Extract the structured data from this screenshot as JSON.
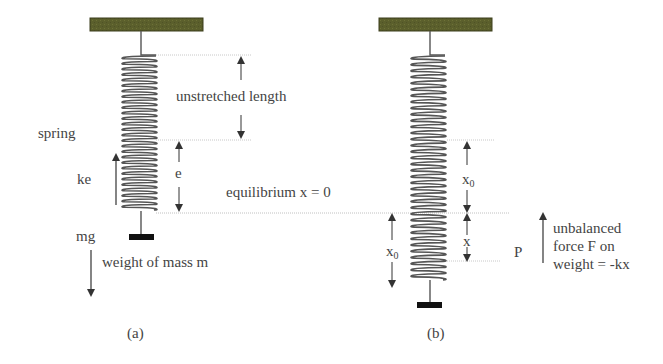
{
  "figure": {
    "colors": {
      "ceiling": "#5b5f2c",
      "ceiling_border": "#3d3f1c",
      "spring": "#555555",
      "mass": "#111111",
      "text": "#444444",
      "arrow": "#333333",
      "dotted_line": "#bbbbbb"
    },
    "panel_a": {
      "caption": "(a)",
      "labels": {
        "spring": "spring",
        "ke": "ke",
        "mg": "mg",
        "weight": "weight of mass m",
        "unstretched": "unstretched length",
        "e": "e",
        "equilibrium": "equilibrium x = 0"
      },
      "spring_coils": 28
    },
    "panel_b": {
      "caption": "(b)",
      "labels": {
        "x0_upper_base": "x",
        "x0_upper_sub": "0",
        "x_disp": "x",
        "x0_left_base": "x",
        "x0_left_sub": "0",
        "P": "P",
        "force_line1": "unbalanced",
        "force_line2": "force F on",
        "force_line3": "weight = -kx"
      },
      "spring_coils": 36
    }
  }
}
